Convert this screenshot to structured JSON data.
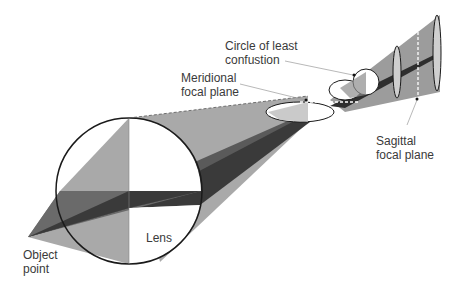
{
  "diagram": {
    "labels": {
      "circle_of_least_confusion": [
        "Circle of least",
        "confustion"
      ],
      "meridional_focal_plane": [
        "Meridional",
        "focal plane"
      ],
      "sagittal_focal_plane": [
        "Sagittal",
        "focal plane"
      ],
      "lens": "Lens",
      "object_point": [
        "Object",
        "point"
      ]
    },
    "colors": {
      "light_gray": "#a9a9a9",
      "mid_gray": "#7d7d7d",
      "dark_gray": "#4a4a4a",
      "darkest": "#2e2e2e",
      "outline": "#1a1a1a",
      "text": "#3a3a3a",
      "leader": "#9a9a9a"
    }
  }
}
